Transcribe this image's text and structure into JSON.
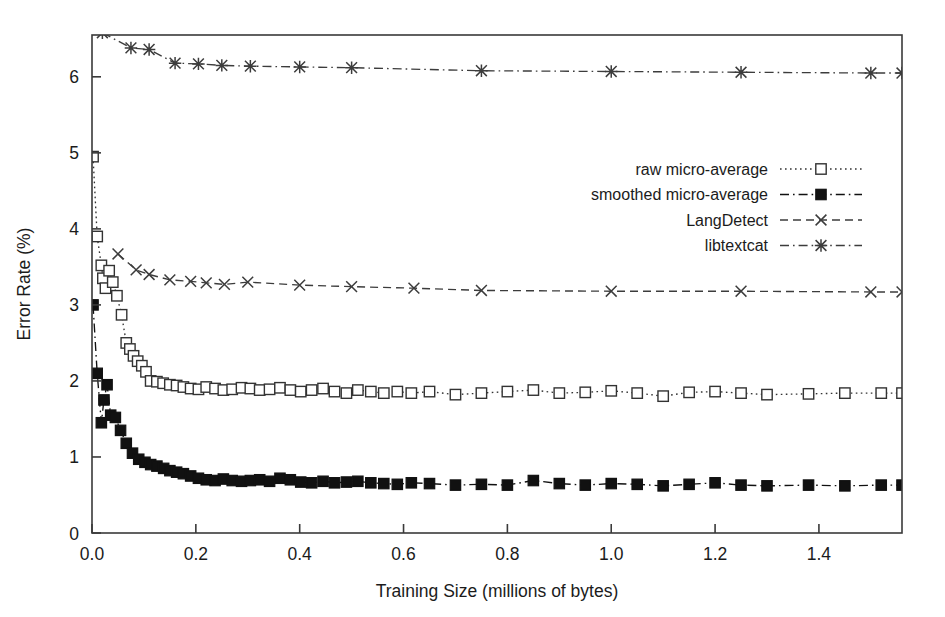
{
  "chart_data": {
    "type": "line",
    "title": "",
    "xlabel": "Training Size (millions of bytes)",
    "ylabel": "Error Rate (%)",
    "xlim": [
      0.0,
      1.56
    ],
    "ylim": [
      0.0,
      6.55
    ],
    "xticks": [
      0.0,
      0.2,
      0.4,
      0.6,
      0.8,
      1.0,
      1.2,
      1.4
    ],
    "xticklabels": [
      "0.0",
      "0.2",
      "0.4",
      "0.6",
      "0.8",
      "1.0",
      "1.2",
      "1.4"
    ],
    "yticks": [
      0,
      1,
      2,
      3,
      4,
      5,
      6
    ],
    "yticklabels": [
      "0",
      "1",
      "2",
      "3",
      "4",
      "5",
      "6"
    ],
    "grid": false,
    "legend_position": "upper-right-inside",
    "frame": "box",
    "series": [
      {
        "name": "raw micro-average",
        "marker": "open-square",
        "linestyle": "dotted",
        "color": "#333333",
        "points": [
          [
            0.002,
            4.95
          ],
          [
            0.01,
            3.9
          ],
          [
            0.018,
            3.52
          ],
          [
            0.021,
            3.35
          ],
          [
            0.026,
            3.22
          ],
          [
            0.033,
            3.45
          ],
          [
            0.04,
            3.3
          ],
          [
            0.048,
            3.12
          ],
          [
            0.057,
            2.87
          ],
          [
            0.066,
            2.5
          ],
          [
            0.073,
            2.42
          ],
          [
            0.08,
            2.33
          ],
          [
            0.088,
            2.26
          ],
          [
            0.096,
            2.2
          ],
          [
            0.104,
            2.12
          ],
          [
            0.113,
            2.0
          ],
          [
            0.125,
            1.99
          ],
          [
            0.137,
            1.97
          ],
          [
            0.15,
            1.95
          ],
          [
            0.163,
            1.94
          ],
          [
            0.176,
            1.92
          ],
          [
            0.19,
            1.9
          ],
          [
            0.205,
            1.89
          ],
          [
            0.22,
            1.92
          ],
          [
            0.237,
            1.9
          ],
          [
            0.253,
            1.88
          ],
          [
            0.27,
            1.89
          ],
          [
            0.288,
            1.91
          ],
          [
            0.305,
            1.9
          ],
          [
            0.323,
            1.88
          ],
          [
            0.342,
            1.89
          ],
          [
            0.362,
            1.91
          ],
          [
            0.382,
            1.88
          ],
          [
            0.402,
            1.86
          ],
          [
            0.423,
            1.88
          ],
          [
            0.445,
            1.9
          ],
          [
            0.467,
            1.86
          ],
          [
            0.49,
            1.84
          ],
          [
            0.512,
            1.88
          ],
          [
            0.537,
            1.86
          ],
          [
            0.562,
            1.84
          ],
          [
            0.588,
            1.86
          ],
          [
            0.615,
            1.84
          ],
          [
            0.65,
            1.86
          ],
          [
            0.7,
            1.82
          ],
          [
            0.75,
            1.84
          ],
          [
            0.8,
            1.86
          ],
          [
            0.85,
            1.88
          ],
          [
            0.9,
            1.84
          ],
          [
            0.95,
            1.85
          ],
          [
            1.0,
            1.87
          ],
          [
            1.05,
            1.84
          ],
          [
            1.1,
            1.8
          ],
          [
            1.15,
            1.85
          ],
          [
            1.2,
            1.86
          ],
          [
            1.25,
            1.84
          ],
          [
            1.3,
            1.82
          ],
          [
            1.38,
            1.83
          ],
          [
            1.45,
            1.84
          ],
          [
            1.52,
            1.84
          ],
          [
            1.56,
            1.84
          ]
        ]
      },
      {
        "name": "smoothed micro-average",
        "marker": "filled-square",
        "linestyle": "dash-dot",
        "color": "#111111",
        "points": [
          [
            0.002,
            3.0
          ],
          [
            0.01,
            2.1
          ],
          [
            0.018,
            1.45
          ],
          [
            0.023,
            1.75
          ],
          [
            0.029,
            1.95
          ],
          [
            0.036,
            1.55
          ],
          [
            0.045,
            1.52
          ],
          [
            0.055,
            1.35
          ],
          [
            0.066,
            1.18
          ],
          [
            0.078,
            1.05
          ],
          [
            0.09,
            0.97
          ],
          [
            0.102,
            0.93
          ],
          [
            0.113,
            0.9
          ],
          [
            0.125,
            0.88
          ],
          [
            0.138,
            0.85
          ],
          [
            0.15,
            0.82
          ],
          [
            0.163,
            0.8
          ],
          [
            0.176,
            0.78
          ],
          [
            0.19,
            0.75
          ],
          [
            0.205,
            0.72
          ],
          [
            0.22,
            0.7
          ],
          [
            0.237,
            0.69
          ],
          [
            0.253,
            0.71
          ],
          [
            0.27,
            0.69
          ],
          [
            0.288,
            0.68
          ],
          [
            0.305,
            0.69
          ],
          [
            0.323,
            0.7
          ],
          [
            0.342,
            0.68
          ],
          [
            0.362,
            0.72
          ],
          [
            0.382,
            0.7
          ],
          [
            0.402,
            0.67
          ],
          [
            0.423,
            0.66
          ],
          [
            0.445,
            0.68
          ],
          [
            0.467,
            0.66
          ],
          [
            0.49,
            0.67
          ],
          [
            0.512,
            0.68
          ],
          [
            0.537,
            0.66
          ],
          [
            0.562,
            0.65
          ],
          [
            0.588,
            0.64
          ],
          [
            0.615,
            0.66
          ],
          [
            0.65,
            0.65
          ],
          [
            0.7,
            0.63
          ],
          [
            0.75,
            0.64
          ],
          [
            0.8,
            0.63
          ],
          [
            0.85,
            0.69
          ],
          [
            0.9,
            0.65
          ],
          [
            0.95,
            0.63
          ],
          [
            1.0,
            0.65
          ],
          [
            1.05,
            0.64
          ],
          [
            1.1,
            0.62
          ],
          [
            1.15,
            0.64
          ],
          [
            1.2,
            0.66
          ],
          [
            1.25,
            0.63
          ],
          [
            1.3,
            0.62
          ],
          [
            1.38,
            0.63
          ],
          [
            1.45,
            0.62
          ],
          [
            1.52,
            0.63
          ],
          [
            1.56,
            0.63
          ]
        ]
      },
      {
        "name": "LangDetect",
        "marker": "x-cross",
        "linestyle": "dashed",
        "color": "#3c3c3c",
        "points": [
          [
            0.05,
            3.67
          ],
          [
            0.085,
            3.46
          ],
          [
            0.11,
            3.4
          ],
          [
            0.15,
            3.33
          ],
          [
            0.19,
            3.31
          ],
          [
            0.22,
            3.29
          ],
          [
            0.255,
            3.27
          ],
          [
            0.3,
            3.3
          ],
          [
            0.4,
            3.26
          ],
          [
            0.5,
            3.24
          ],
          [
            0.62,
            3.22
          ],
          [
            0.75,
            3.19
          ],
          [
            1.0,
            3.18
          ],
          [
            1.25,
            3.18
          ],
          [
            1.5,
            3.17
          ],
          [
            1.56,
            3.17
          ]
        ]
      },
      {
        "name": "libtextcat",
        "marker": "asterisk",
        "linestyle": "dash-dot",
        "color": "#3c3c3c",
        "points": [
          [
            0.02,
            6.58
          ],
          [
            0.075,
            6.38
          ],
          [
            0.11,
            6.36
          ],
          [
            0.16,
            6.18
          ],
          [
            0.205,
            6.17
          ],
          [
            0.25,
            6.15
          ],
          [
            0.305,
            6.14
          ],
          [
            0.4,
            6.13
          ],
          [
            0.5,
            6.12
          ],
          [
            0.75,
            6.08
          ],
          [
            1.0,
            6.07
          ],
          [
            1.25,
            6.06
          ],
          [
            1.5,
            6.05
          ],
          [
            1.56,
            6.05
          ]
        ]
      }
    ]
  },
  "legend": {
    "items": [
      {
        "label": "raw micro-average"
      },
      {
        "label": "smoothed micro-average"
      },
      {
        "label": "LangDetect"
      },
      {
        "label": "libtextcat"
      }
    ]
  }
}
